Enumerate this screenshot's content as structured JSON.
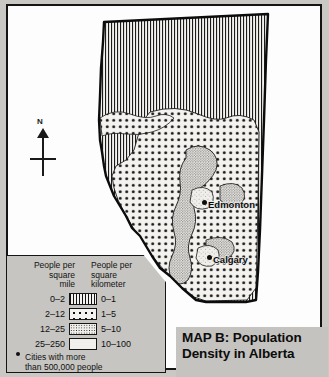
{
  "map": {
    "title_line1": "MAP B: Population",
    "title_line2": "Density in Alberta",
    "region": "Alberta",
    "compass_label": "N",
    "cities": [
      {
        "name": "Edmonton",
        "x": 202,
        "y": 200
      },
      {
        "name": "Calgary",
        "x": 207,
        "y": 255
      }
    ]
  },
  "legend": {
    "header_mile_line1": "People per",
    "header_mile_line2": "square",
    "header_mile_line3": "mile",
    "header_km_line1": "People per",
    "header_km_line2": "square",
    "header_km_line3": "kilometer",
    "rows": [
      {
        "mile": "0–2",
        "km": "0–1",
        "pattern": "vertical-lines"
      },
      {
        "mile": "2–12",
        "km": "1–5",
        "pattern": "large-dots"
      },
      {
        "mile": "12–25",
        "km": "5–10",
        "pattern": "fine-stipple"
      },
      {
        "mile": "25–250",
        "km": "10–100",
        "pattern": "light-stipple"
      }
    ],
    "note_line1": "Cities with more",
    "note_line2": "than 500,000 people"
  },
  "colors": {
    "page_background": "#c9c8c4",
    "frame_background": "#fdfdfd",
    "ink": "#141414",
    "legend_background": "#c6c5c1",
    "title_band": "#c4c3bf"
  }
}
